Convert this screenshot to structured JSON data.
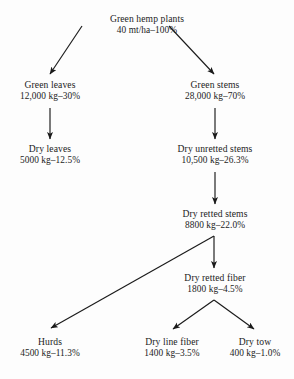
{
  "figure": {
    "kind": "flowchart",
    "background_color": "#fdfdfd",
    "text_color": "#1c1c1c",
    "arrow_color": "#1a1a1a"
  },
  "nodes": [
    {
      "id": "green-hemp-plants",
      "name": "Green hemp plants",
      "value": "40 mt/ha–100%",
      "x": 147,
      "y": 14
    },
    {
      "id": "green-leaves",
      "name": "Green leaves",
      "value": "12,000 kg–30%",
      "x": 50,
      "y": 80
    },
    {
      "id": "green-stems",
      "name": "Green stems",
      "value": "28,000 kg–70%",
      "x": 215,
      "y": 80
    },
    {
      "id": "dry-leaves",
      "name": "Dry leaves",
      "value": "5000 kg–12.5%",
      "x": 50,
      "y": 144
    },
    {
      "id": "dry-unretted-stems",
      "name": "Dry unretted stems",
      "value": "10,500 kg–26.3%",
      "x": 215,
      "y": 144
    },
    {
      "id": "dry-retted-stems",
      "name": "Dry retted stems",
      "value": "8800 kg–22.0%",
      "x": 215,
      "y": 209
    },
    {
      "id": "dry-retted-fiber",
      "name": "Dry retted fiber",
      "value": "1800 kg–4.5%",
      "x": 215,
      "y": 273
    },
    {
      "id": "hurds",
      "name": "Hurds",
      "value": "4500 kg–11.3%",
      "x": 50,
      "y": 337
    },
    {
      "id": "dry-line-fiber",
      "name": "Dry line fiber",
      "value": "1400 kg–3.5%",
      "x": 172,
      "y": 337
    },
    {
      "id": "dry-tow",
      "name": "Dry tow",
      "value": "400 kg–1.0%",
      "x": 255,
      "y": 337
    }
  ],
  "edges": [
    {
      "id": "plants-to-green-leaves",
      "from": "green-hemp-plants",
      "to": "green-leaves",
      "x1": 82,
      "y1": 26,
      "x2": 50,
      "y2": 74
    },
    {
      "id": "plants-to-green-stems",
      "from": "green-hemp-plants",
      "to": "green-stems",
      "x1": 169,
      "y1": 26,
      "x2": 214,
      "y2": 74
    },
    {
      "id": "green-leaves-to-dry-leaves",
      "from": "green-leaves",
      "to": "dry-leaves",
      "x1": 50,
      "y1": 108,
      "x2": 50,
      "y2": 139
    },
    {
      "id": "green-stems-to-dry-unretted-stems",
      "from": "green-stems",
      "to": "dry-unretted-stems",
      "x1": 215,
      "y1": 108,
      "x2": 215,
      "y2": 139
    },
    {
      "id": "dry-unretted-to-dry-retted-stems",
      "from": "dry-unretted-stems",
      "to": "dry-retted-stems",
      "x1": 215,
      "y1": 172,
      "x2": 215,
      "y2": 204
    },
    {
      "id": "dry-retted-stems-to-hurds",
      "from": "dry-retted-stems",
      "to": "hurds",
      "x1": 214,
      "y1": 236,
      "x2": 51,
      "y2": 328
    },
    {
      "id": "dry-retted-stems-to-dry-retted-fiber",
      "from": "dry-retted-stems",
      "to": "dry-retted-fiber",
      "x1": 214,
      "y1": 236,
      "x2": 214,
      "y2": 268
    },
    {
      "id": "dry-retted-fiber-to-dry-line-fiber",
      "from": "dry-retted-fiber",
      "to": "dry-line-fiber",
      "x1": 214,
      "y1": 300,
      "x2": 173,
      "y2": 329
    },
    {
      "id": "dry-retted-fiber-to-dry-tow",
      "from": "dry-retted-fiber",
      "to": "dry-tow",
      "x1": 214,
      "y1": 300,
      "x2": 254,
      "y2": 329
    }
  ]
}
